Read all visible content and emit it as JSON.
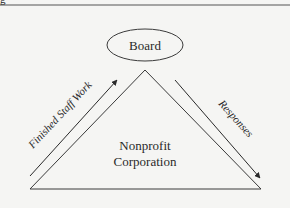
{
  "diagram": {
    "top_node": {
      "label": "Board"
    },
    "center_node": {
      "line1": "Nonprofit",
      "line2": "Corporation"
    },
    "left_arrow": {
      "label": "Finished Staff Work",
      "direction": "up"
    },
    "right_arrow": {
      "label": "Responses",
      "direction": "down"
    },
    "partial_caption_glyph": "g"
  },
  "colors": {
    "background": "#f5f5f3",
    "stroke": "#3a3a3a",
    "rule": "#555555"
  }
}
